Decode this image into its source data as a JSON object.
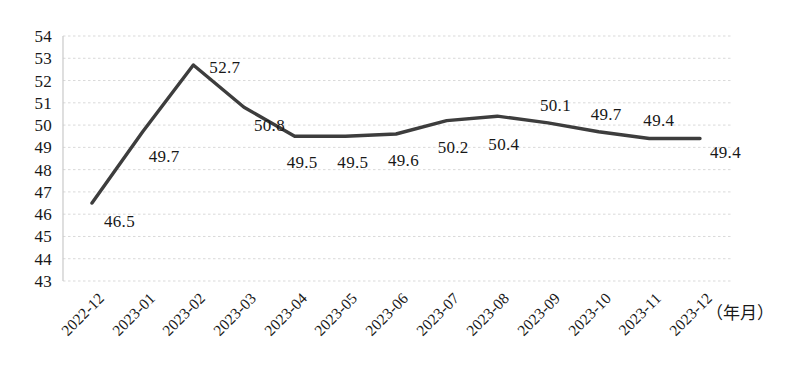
{
  "chart_data": {
    "type": "line",
    "title": "",
    "xlabel": "（年月）",
    "ylabel": "",
    "categories": [
      "2022-12",
      "2023-01",
      "2023-02",
      "2023-03",
      "2023-04",
      "2023-05",
      "2023-06",
      "2023-07",
      "2023-08",
      "2023-09",
      "2023-10",
      "2023-11",
      "2023-12"
    ],
    "values": [
      46.5,
      49.7,
      52.7,
      50.8,
      49.5,
      49.5,
      49.6,
      50.2,
      50.4,
      50.1,
      49.7,
      49.4,
      49.4
    ],
    "point_labels": [
      "46.5",
      "49.7",
      "52.7",
      "50.8",
      "49.5",
      "49.5",
      "49.6",
      "50.2",
      "50.4",
      "50.1",
      "49.7",
      "49.4",
      "49.4"
    ],
    "ylim": [
      43,
      54
    ],
    "y_ticks": [
      54,
      53,
      52,
      51,
      50,
      49,
      48,
      47,
      46,
      45,
      44,
      43
    ],
    "y_tick_labels": [
      "54",
      "53",
      "52",
      "51",
      "50",
      "49",
      "48",
      "47",
      "46",
      "45",
      "44",
      "43"
    ],
    "grid": true,
    "grid_style": "dotted-horizontal",
    "legend": "none",
    "series_color": "#3d3d3d",
    "grid_color": "#d9d9d9",
    "axis_color": "#b8b8b8"
  }
}
